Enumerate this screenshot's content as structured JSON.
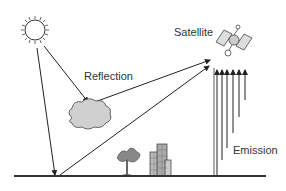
{
  "diagram": {
    "labels": {
      "satellite": "Satellite",
      "reflection": "Reflection",
      "emission": "Emission"
    },
    "elements": [
      "sun-icon",
      "cloud-icon",
      "satellite-icon",
      "tree-icon",
      "buildings-icon",
      "ground-line"
    ],
    "colors": {
      "line": "#222222",
      "cloud_fill": "#d0d0d0",
      "building_fill": "#bbbbbb"
    }
  }
}
